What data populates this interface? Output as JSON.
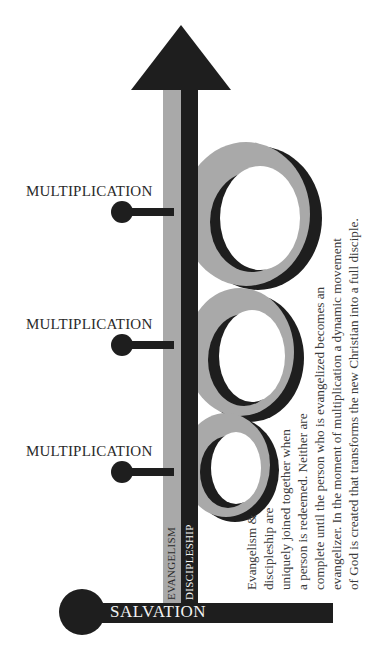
{
  "diagram": {
    "colors": {
      "black": "#1e1e1e",
      "gray": "#a9a9a9",
      "white": "#ffffff",
      "text": "#2a2a2a"
    },
    "multiplication_labels": [
      {
        "label": "MULTIPLICATION"
      },
      {
        "label": "MULTIPLICATION"
      },
      {
        "label": "MULTIPLICATION"
      }
    ],
    "vertical_labels": {
      "evangelism": "EVANGELISM",
      "discipleship": "DISCIPLESHIP"
    },
    "base_label": "SALVATION",
    "description_lines": [
      "Evangelism &",
      "discipleship are",
      "uniquely joined together when",
      "a person is redeemed. Neither are",
      "complete until the person who is evangelized becomes an",
      "evangelizer. In the moment of multiplication a dynamic movement",
      "of God is created that transforms the new Christian into a full disciple."
    ],
    "icons": {
      "arrow": "up-arrow-icon",
      "node": "circle-node-icon"
    }
  }
}
